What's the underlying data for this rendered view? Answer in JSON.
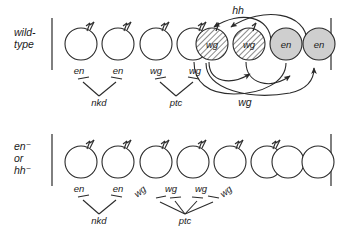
{
  "figure": {
    "background": "#ffffff",
    "line_color": "#2a2a2a",
    "text_color": "#1a1a1a",
    "hatch_fill": "#ffffff",
    "solid_fill": "#cfcfcf"
  },
  "panels": [
    {
      "id": "wild-type",
      "row_label_lines": [
        "wild-",
        "type"
      ],
      "cells": [
        {
          "index": 0,
          "fill": "none",
          "hairs": true,
          "label": ""
        },
        {
          "index": 1,
          "fill": "none",
          "hairs": true,
          "label": ""
        },
        {
          "index": 2,
          "fill": "none",
          "hairs": true,
          "label": ""
        },
        {
          "index": 3,
          "fill": "none",
          "hairs": true,
          "label": ""
        },
        {
          "index": 4,
          "fill": "hatch",
          "hairs": true,
          "label": "wg"
        },
        {
          "index": 5,
          "fill": "hatch",
          "hairs": true,
          "label": "wg"
        },
        {
          "index": 6,
          "fill": "solid",
          "hairs": false,
          "label": "en"
        },
        {
          "index": 7,
          "fill": "solid",
          "hairs": false,
          "label": "en"
        }
      ],
      "gene_labels": [
        {
          "text": "en",
          "cell": 0
        },
        {
          "text": "en",
          "cell": 1
        },
        {
          "text": "wg",
          "cell": 2
        },
        {
          "text": "wg",
          "cell": 3
        }
      ],
      "repressors": [
        {
          "text": "nkd",
          "targets": [
            "en",
            "en"
          ]
        },
        {
          "text": "ptc",
          "targets": [
            "wg",
            "wg"
          ]
        }
      ],
      "signal_arcs": [
        {
          "label": "hh",
          "direction": "right-to-left",
          "position": "above",
          "from": [
            "en",
            "en"
          ],
          "to": [
            "wg",
            "wg"
          ]
        },
        {
          "label": "wg",
          "direction": "left-to-right",
          "position": "below",
          "from": [
            "wg",
            "wg"
          ],
          "to": [
            "en",
            "en"
          ]
        }
      ]
    },
    {
      "id": "en-or-hh-mutant",
      "row_label_lines": [
        "en⁻",
        "or",
        "hh⁻"
      ],
      "cells": [
        {
          "index": 0,
          "fill": "none",
          "hairs": true,
          "label": ""
        },
        {
          "index": 1,
          "fill": "none",
          "hairs": true,
          "label": ""
        },
        {
          "index": 2,
          "fill": "none",
          "hairs": true,
          "label": ""
        },
        {
          "index": 3,
          "fill": "none",
          "hairs": true,
          "label": ""
        },
        {
          "index": 4,
          "fill": "none",
          "hairs": true,
          "label": ""
        },
        {
          "index": 5,
          "fill": "none",
          "hairs": true,
          "label": ""
        },
        {
          "index": 6,
          "fill": "none",
          "hairs": false,
          "label": ""
        },
        {
          "index": 7,
          "fill": "none",
          "hairs": false,
          "label": ""
        }
      ],
      "gene_labels": [
        {
          "text": "en",
          "cell": 0,
          "rotated": false
        },
        {
          "text": "en",
          "cell": 1,
          "rotated": false
        },
        {
          "text": "wg",
          "cell": 2,
          "rotated": true
        },
        {
          "text": "wg",
          "cell": 3,
          "rotated": false
        },
        {
          "text": "wg",
          "cell": 4,
          "rotated": false
        },
        {
          "text": "wg",
          "cell": 5,
          "rotated": true
        }
      ],
      "repressors": [
        {
          "text": "nkd",
          "targets": [
            "en",
            "en"
          ]
        },
        {
          "text": "ptc",
          "targets": [
            "wg",
            "wg",
            "wg",
            "wg"
          ]
        }
      ],
      "signal_arcs": []
    }
  ]
}
